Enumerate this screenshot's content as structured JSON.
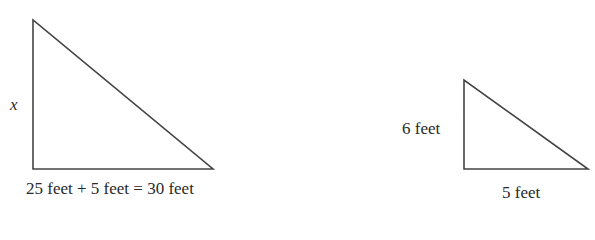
{
  "diagram": {
    "type": "similar-right-triangles",
    "stroke_color": "#444444",
    "large_triangle": {
      "vertices": {
        "top": [
          33,
          20
        ],
        "right_angle": [
          33,
          169
        ],
        "right": [
          213,
          169
        ]
      },
      "vertical_label": "x",
      "base_label": "25 feet + 5 feet = 30 feet"
    },
    "small_triangle": {
      "vertices": {
        "top": [
          464,
          80
        ],
        "right_angle": [
          464,
          169
        ],
        "right": [
          588,
          169
        ]
      },
      "vertical_label": "6 feet",
      "base_label": "5 feet"
    }
  }
}
